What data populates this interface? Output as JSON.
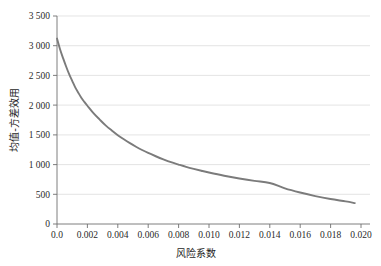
{
  "chart_data": {
    "type": "line",
    "title": "",
    "xlabel": "风险系数",
    "ylabel": "均值-方差效用",
    "xlim": [
      0.0,
      0.0206
    ],
    "ylim": [
      0,
      3500
    ],
    "grid": true,
    "legend": false,
    "legend_position": "none",
    "line_color": "#7b7b7b",
    "grid_color": "#d8d8d8",
    "axis_color": "#6f6f6f",
    "xticks": [
      0.0,
      0.002,
      0.004,
      0.006,
      0.008,
      0.01,
      0.012,
      0.014,
      0.016,
      0.018,
      0.02
    ],
    "xticklabels": [
      "0.0",
      "0.002",
      "0.004",
      "0.006",
      "0.008",
      "0.010",
      "0.012",
      "0.014",
      "0.016",
      "0.018",
      "0.020"
    ],
    "yticks": [
      0,
      500,
      1000,
      1500,
      2000,
      2500,
      3000,
      3500
    ],
    "yticklabels": [
      "0",
      "500",
      "1 000",
      "1 500",
      "2 000",
      "2 500",
      "3 000",
      "3 500"
    ],
    "series": [
      {
        "name": "均值-方差效用",
        "color": "#7b7b7b",
        "x": [
          0.0,
          0.0002,
          0.0004,
          0.0006,
          0.0008,
          0.001,
          0.0012,
          0.0014,
          0.0016,
          0.0018,
          0.002,
          0.0024,
          0.0028,
          0.0032,
          0.0036,
          0.004,
          0.0044,
          0.0048,
          0.0052,
          0.0056,
          0.006,
          0.0065,
          0.007,
          0.0075,
          0.008,
          0.0085,
          0.009,
          0.0095,
          0.01,
          0.011,
          0.012,
          0.013,
          0.014,
          0.015,
          0.016,
          0.017,
          0.018,
          0.019,
          0.0196
        ],
        "y": [
          3120,
          2940,
          2790,
          2650,
          2520,
          2410,
          2300,
          2210,
          2125,
          2055,
          1990,
          1865,
          1760,
          1660,
          1575,
          1495,
          1425,
          1360,
          1300,
          1245,
          1195,
          1140,
          1088,
          1040,
          1000,
          962,
          928,
          896,
          866,
          812,
          766,
          725,
          690,
          600,
          530,
          470,
          420,
          380,
          352
        ]
      }
    ]
  }
}
